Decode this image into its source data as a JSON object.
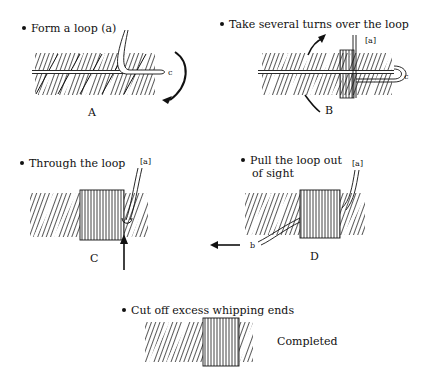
{
  "steps": [
    {
      "id": "A",
      "caption": "Form a loop (a)",
      "label": "A",
      "markers": [
        "c"
      ]
    },
    {
      "id": "B",
      "caption": "Take several turns over the loop",
      "label": "B",
      "markers": [
        "[a]",
        "c"
      ]
    },
    {
      "id": "C",
      "caption": "Through the loop",
      "label": "C",
      "markers": [
        "[a]"
      ]
    },
    {
      "id": "D",
      "caption_line1": "Pull the loop out",
      "caption_line2": "of sight",
      "label": "D",
      "markers": [
        "[a]",
        "b"
      ]
    },
    {
      "id": "E",
      "caption": "Cut off excess whipping ends",
      "label": "Completed"
    }
  ],
  "colors": {
    "ink": "#111111",
    "background": "#ffffff"
  }
}
